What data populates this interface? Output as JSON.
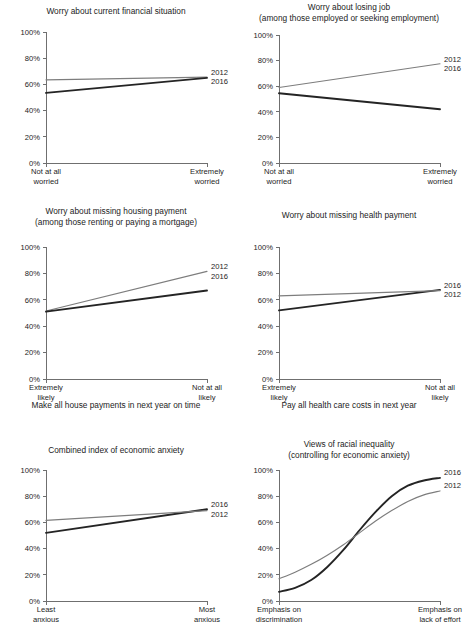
{
  "figure": {
    "series_names": [
      "2012",
      "2016"
    ],
    "colors": {
      "series_2012": "#7d7d7d",
      "series_2016": "#242424",
      "axis": "#6f6f6f",
      "text": "#1c1c1c"
    },
    "y_ticks": [
      "0%",
      "20%",
      "40%",
      "60%",
      "80%",
      "100%"
    ]
  },
  "chart_data": [
    {
      "id": "worry-current-financial-situation",
      "type": "line",
      "title": [
        "Worry about current financial situation"
      ],
      "xlabel": "",
      "ylabel": "",
      "ylim": [
        0,
        100
      ],
      "yticks": [
        0,
        20,
        40,
        60,
        80,
        100
      ],
      "ytick_labels": [
        "0%",
        "20%",
        "40%",
        "60%",
        "80%",
        "100%"
      ],
      "grid": false,
      "legend_position": "right-end-of-line",
      "x_categories": [
        "Not at all worried",
        "Extremely worried"
      ],
      "x_tick_lines": [
        [
          "Not at all",
          "worried"
        ],
        [
          "Extremely",
          "worried"
        ]
      ],
      "series": [
        {
          "name": "2012",
          "values": [
            63.5,
            65.5
          ],
          "label_order": 1
        },
        {
          "name": "2016",
          "values": [
            53.5,
            65.0
          ],
          "label_order": 2
        }
      ]
    },
    {
      "id": "worry-losing-job",
      "type": "line",
      "title": [
        "Worry about losing job",
        "(among those employed or seeking employment)"
      ],
      "xlabel": "",
      "ylabel": "",
      "ylim": [
        0,
        100
      ],
      "yticks": [
        0,
        20,
        40,
        60,
        80,
        100
      ],
      "ytick_labels": [
        "0%",
        "20%",
        "40%",
        "60%",
        "80%",
        "100%"
      ],
      "grid": false,
      "legend_position": "right-end-of-line",
      "x_categories": [
        "Not at all worried",
        "Extremely worried"
      ],
      "x_tick_lines": [
        [
          "Not at all",
          "worried"
        ],
        [
          "Extremely",
          "worried"
        ]
      ],
      "series": [
        {
          "name": "2012",
          "values": [
            59.0,
            77.5
          ],
          "label_order": 1
        },
        {
          "name": "2016",
          "values": [
            54.5,
            42.0
          ],
          "label_order": 2
        }
      ]
    },
    {
      "id": "worry-missing-housing-payment",
      "type": "line",
      "title": [
        "Worry about missing housing payment",
        "(among those renting or paying a mortgage)"
      ],
      "xlabel": "Make all house payments in next year on time",
      "ylabel": "",
      "ylim": [
        0,
        100
      ],
      "yticks": [
        0,
        20,
        40,
        60,
        80,
        100
      ],
      "ytick_labels": [
        "0%",
        "20%",
        "40%",
        "60%",
        "80%",
        "100%"
      ],
      "grid": false,
      "legend_position": "right-end-of-line",
      "x_categories": [
        "Extremely likely",
        "Not at all likely"
      ],
      "x_tick_lines": [
        [
          "Extremely",
          "likely"
        ],
        [
          "Not at all",
          "likely"
        ]
      ],
      "series": [
        {
          "name": "2012",
          "values": [
            51.5,
            81.5
          ],
          "label_order": 1
        },
        {
          "name": "2016",
          "values": [
            51.0,
            67.0
          ],
          "label_order": 2
        }
      ]
    },
    {
      "id": "worry-missing-health-payment",
      "type": "line",
      "title": [
        "Worry about missing health payment"
      ],
      "xlabel": "Pay all health care costs in next year",
      "ylabel": "",
      "ylim": [
        0,
        100
      ],
      "yticks": [
        0,
        20,
        40,
        60,
        80,
        100
      ],
      "ytick_labels": [
        "0%",
        "20%",
        "40%",
        "60%",
        "80%",
        "100%"
      ],
      "grid": false,
      "legend_position": "right-end-of-line",
      "x_categories": [
        "Extremely likely",
        "Not at all likely"
      ],
      "x_tick_lines": [
        [
          "Extremely",
          "likely"
        ],
        [
          "Not at all",
          "likely"
        ]
      ],
      "series": [
        {
          "name": "2016",
          "values": [
            52.0,
            67.5
          ],
          "label_order": 1
        },
        {
          "name": "2012",
          "values": [
            63.0,
            67.0
          ],
          "label_order": 2
        }
      ]
    },
    {
      "id": "combined-index-economic-anxiety",
      "type": "line",
      "title": [
        "Combined index of economic anxiety"
      ],
      "xlabel": "",
      "ylabel": "",
      "ylim": [
        0,
        100
      ],
      "yticks": [
        0,
        20,
        40,
        60,
        80,
        100
      ],
      "ytick_labels": [
        "0%",
        "20%",
        "40%",
        "60%",
        "80%",
        "100%"
      ],
      "grid": false,
      "legend_position": "right-end-of-line",
      "x_categories": [
        "Least anxious",
        "Most anxious"
      ],
      "x_tick_lines": [
        [
          "Least",
          "anxious"
        ],
        [
          "Most",
          "anxious"
        ]
      ],
      "series": [
        {
          "name": "2016",
          "values": [
            52.0,
            70.0
          ],
          "label_order": 1
        },
        {
          "name": "2012",
          "values": [
            61.5,
            69.0
          ],
          "label_order": 2
        }
      ]
    },
    {
      "id": "views-racial-inequality",
      "type": "line",
      "title": [
        "Views of racial inequality",
        "(controlling for economic anxiety)"
      ],
      "xlabel": "",
      "ylabel": "",
      "ylim": [
        0,
        100
      ],
      "yticks": [
        0,
        20,
        40,
        60,
        80,
        100
      ],
      "ytick_labels": [
        "0%",
        "20%",
        "40%",
        "60%",
        "80%",
        "100%"
      ],
      "grid": false,
      "legend_position": "right-end-of-line",
      "x_categories": [
        "Emphasis on discrimination",
        "Emphasis on lack of effort"
      ],
      "x_tick_lines": [
        [
          "Emphasis on",
          "discrimination"
        ],
        [
          "Emphasis on",
          "lack of effort"
        ]
      ],
      "curve": true,
      "series": [
        {
          "name": "2016",
          "values": [
            7,
            10,
            16,
            26,
            39,
            54,
            68,
            80,
            88,
            92,
            94
          ],
          "label_order": 1
        },
        {
          "name": "2012",
          "values": [
            17,
            22,
            28,
            35,
            43,
            52,
            61,
            69,
            76,
            81,
            84
          ],
          "label_order": 2
        }
      ]
    }
  ]
}
